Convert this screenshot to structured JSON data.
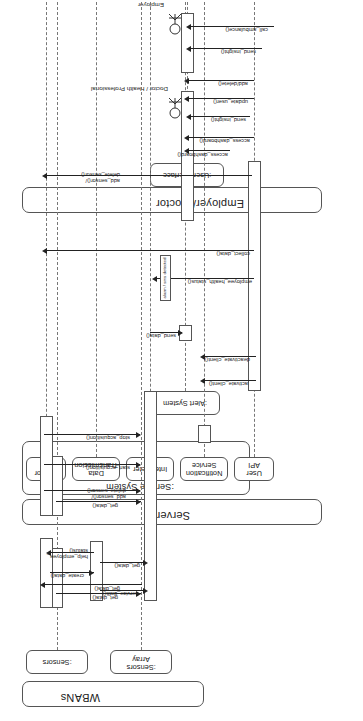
{
  "diagram": {
    "type": "uml-sequence-diagram",
    "orientation": "rotated-90",
    "groups": [
      {
        "id": "wbans",
        "label": "WBANs"
      },
      {
        "id": "server",
        "label": "Server"
      },
      {
        "id": "employer",
        "label": "Employer/ Doctor"
      }
    ],
    "subgroups": [
      {
        "id": "service-system",
        "label": ":Service System",
        "parent": "server"
      }
    ],
    "lifelines": [
      {
        "id": "sensors",
        "label": ":Sensors",
        "group": "wbans"
      },
      {
        "id": "sensors-array",
        "label": ":Sensors\nArray",
        "group": "wbans"
      },
      {
        "id": "sensor-api",
        "label": "Sensor\nAPI",
        "group": "service-system"
      },
      {
        "id": "data-trans",
        "label": "Data\nTransmission",
        "group": "service-system"
      },
      {
        "id": "interpreter",
        "label": "Interpreter",
        "group": "service-system"
      },
      {
        "id": "notification",
        "label": "Notification\nService",
        "group": "service-system"
      },
      {
        "id": "user-api",
        "label": "User\nAPI",
        "group": "service-system"
      },
      {
        "id": "alert-system",
        "label": ":Alert System",
        "group": "server"
      },
      {
        "id": "user-interface",
        "label": ":User Interface",
        "group": "employer"
      }
    ],
    "actors": [
      {
        "id": "doctor",
        "label": "Doctor / Health\nProfessional",
        "group": "employer"
      },
      {
        "id": "employer",
        "label": "Employer",
        "group": "employer"
      }
    ],
    "messages": [
      {
        "id": "m1",
        "label": "get_data()"
      },
      {
        "id": "m2",
        "label": "get_data()"
      },
      {
        "id": "m3",
        "label": "get_data()"
      },
      {
        "id": "m4",
        "label": "get_data()"
      },
      {
        "id": "m5",
        "label": "add_sensor()/\ndelete_sensor()"
      },
      {
        "id": "m6",
        "label": "start_acquisition()"
      },
      {
        "id": "m7",
        "label": "stop_acquisition()"
      },
      {
        "id": "m8",
        "label": "add_sensor()/\ndelete_sensor()"
      },
      {
        "id": "m9",
        "label": "create_data()"
      },
      {
        "id": "m10",
        "label": "help_employee_\nstatus()"
      },
      {
        "id": "m11",
        "label": "service_data()"
      },
      {
        "id": "m12",
        "label": "send_data()"
      },
      {
        "id": "m13",
        "label": "activate_client()"
      },
      {
        "id": "m14",
        "label": "deactivate_client()"
      },
      {
        "id": "m15",
        "label": "employee_health_status()"
      },
      {
        "id": "m16",
        "label": "collect_data()"
      },
      {
        "id": "m17",
        "label": "access_dashboard()"
      },
      {
        "id": "m18",
        "label": "access_dashboard()"
      },
      {
        "id": "m19",
        "label": "send_insight()"
      },
      {
        "id": "m20",
        "label": "update_user()"
      },
      {
        "id": "m21",
        "label": "add/delete()"
      },
      {
        "id": "m22",
        "label": "add_sensor()/\ndelete_sensor()"
      },
      {
        "id": "m23",
        "label": "send_insight()"
      },
      {
        "id": "m24",
        "label": "call_ambulance()"
      }
    ],
    "notes": [
      {
        "id": "n1",
        "label": "alarm / sms detected"
      }
    ]
  }
}
